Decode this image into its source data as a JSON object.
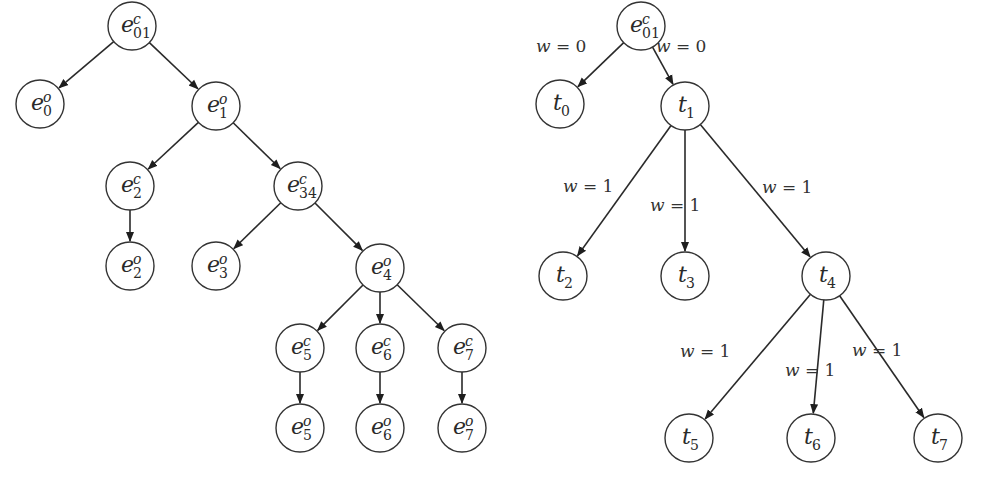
{
  "diagram": {
    "left_tree": {
      "name": "event-tree",
      "nodes": [
        {
          "id": "e01c",
          "base": "e",
          "sup": "c",
          "sub": "01",
          "x": 132,
          "y": 26
        },
        {
          "id": "e0o",
          "base": "e",
          "sup": "o",
          "sub": "0",
          "x": 40,
          "y": 104
        },
        {
          "id": "e1o",
          "base": "e",
          "sup": "o",
          "sub": "1",
          "x": 216,
          "y": 106
        },
        {
          "id": "e2c",
          "base": "e",
          "sup": "c",
          "sub": "2",
          "x": 130,
          "y": 186
        },
        {
          "id": "e34c",
          "base": "e",
          "sup": "c",
          "sub": "34",
          "x": 298,
          "y": 186
        },
        {
          "id": "e2o",
          "base": "e",
          "sup": "o",
          "sub": "2",
          "x": 130,
          "y": 266
        },
        {
          "id": "e3o",
          "base": "e",
          "sup": "o",
          "sub": "3",
          "x": 216,
          "y": 266
        },
        {
          "id": "e4o",
          "base": "e",
          "sup": "o",
          "sub": "4",
          "x": 380,
          "y": 268
        },
        {
          "id": "e5c",
          "base": "e",
          "sup": "c",
          "sub": "5",
          "x": 300,
          "y": 348
        },
        {
          "id": "e6c",
          "base": "e",
          "sup": "c",
          "sub": "6",
          "x": 380,
          "y": 348
        },
        {
          "id": "e7c",
          "base": "e",
          "sup": "c",
          "sub": "7",
          "x": 462,
          "y": 348
        },
        {
          "id": "e5o",
          "base": "e",
          "sup": "o",
          "sub": "5",
          "x": 300,
          "y": 428
        },
        {
          "id": "e6o",
          "base": "e",
          "sup": "o",
          "sub": "6",
          "x": 380,
          "y": 428
        },
        {
          "id": "e7o",
          "base": "e",
          "sup": "o",
          "sub": "7",
          "x": 462,
          "y": 428
        }
      ],
      "edges": [
        [
          "e01c",
          "e0o"
        ],
        [
          "e01c",
          "e1o"
        ],
        [
          "e1o",
          "e2c"
        ],
        [
          "e1o",
          "e34c"
        ],
        [
          "e2c",
          "e2o"
        ],
        [
          "e34c",
          "e3o"
        ],
        [
          "e34c",
          "e4o"
        ],
        [
          "e4o",
          "e5c"
        ],
        [
          "e4o",
          "e6c"
        ],
        [
          "e4o",
          "e7c"
        ],
        [
          "e5c",
          "e5o"
        ],
        [
          "e6c",
          "e6o"
        ],
        [
          "e7c",
          "e7o"
        ]
      ]
    },
    "right_tree": {
      "name": "weighted-task-tree",
      "nodes": [
        {
          "id": "r_e01c",
          "base": "e",
          "sup": "c",
          "sub": "01",
          "x": 641,
          "y": 26
        },
        {
          "id": "t0",
          "base": "t",
          "sup": "",
          "sub": "0",
          "x": 560,
          "y": 104
        },
        {
          "id": "t1",
          "base": "t",
          "sup": "",
          "sub": "1",
          "x": 685,
          "y": 106
        },
        {
          "id": "t2",
          "base": "t",
          "sup": "",
          "sub": "2",
          "x": 563,
          "y": 276
        },
        {
          "id": "t3",
          "base": "t",
          "sup": "",
          "sub": "3",
          "x": 685,
          "y": 276
        },
        {
          "id": "t4",
          "base": "t",
          "sup": "",
          "sub": "4",
          "x": 826,
          "y": 276
        },
        {
          "id": "t5",
          "base": "t",
          "sup": "",
          "sub": "5",
          "x": 689,
          "y": 438
        },
        {
          "id": "t6",
          "base": "t",
          "sup": "",
          "sub": "6",
          "x": 811,
          "y": 438
        },
        {
          "id": "t7",
          "base": "t",
          "sup": "",
          "sub": "7",
          "x": 938,
          "y": 438
        }
      ],
      "edges": [
        {
          "from": "r_e01c",
          "to": "t0",
          "weight": "w = 0",
          "lx": 536,
          "ly": 52
        },
        {
          "from": "r_e01c",
          "to": "t1",
          "weight": "w = 0",
          "lx": 656,
          "ly": 52
        },
        {
          "from": "t1",
          "to": "t2",
          "weight": "w = 1",
          "lx": 563,
          "ly": 192
        },
        {
          "from": "t1",
          "to": "t3",
          "weight": "w = 1",
          "lx": 650,
          "ly": 211
        },
        {
          "from": "t1",
          "to": "t4",
          "weight": "w = 1",
          "lx": 762,
          "ly": 193
        },
        {
          "from": "t4",
          "to": "t5",
          "weight": "w = 1",
          "lx": 680,
          "ly": 357
        },
        {
          "from": "t4",
          "to": "t6",
          "weight": "w = 1",
          "lx": 785,
          "ly": 376
        },
        {
          "from": "t4",
          "to": "t7",
          "weight": "w = 1",
          "lx": 852,
          "ly": 356
        }
      ]
    },
    "style": {
      "node_radius": 24,
      "stroke_color": "#333333",
      "background": "#ffffff"
    }
  }
}
